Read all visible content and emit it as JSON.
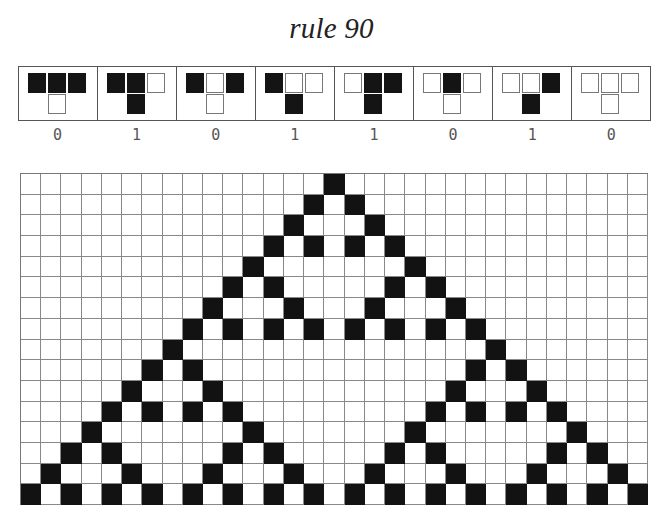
{
  "title": "rule 90",
  "rule": {
    "number": 90,
    "neighborhoods": [
      {
        "pattern": "111",
        "output": 0,
        "label": "0"
      },
      {
        "pattern": "110",
        "output": 1,
        "label": "1"
      },
      {
        "pattern": "101",
        "output": 0,
        "label": "0"
      },
      {
        "pattern": "100",
        "output": 1,
        "label": "1"
      },
      {
        "pattern": "011",
        "output": 1,
        "label": "1"
      },
      {
        "pattern": "010",
        "output": 0,
        "label": "0"
      },
      {
        "pattern": "001",
        "output": 1,
        "label": "1"
      },
      {
        "pattern": "000",
        "output": 0,
        "label": "0"
      }
    ]
  },
  "grid": {
    "columns": 31,
    "rows": 16,
    "colors": {
      "on": "#121212",
      "off": "#ffffff",
      "line": "#888888"
    },
    "states": [
      "0000000000000001000000000000000",
      "0000000000000010100000000000000",
      "0000000000000100010000000000000",
      "0000000000001010101000000000000",
      "0000000000010000000100000000000",
      "0000000000101000001010000000000",
      "0000000001000100010001000000000",
      "0000000010101010101010100000000",
      "0000000100000000000000010000000",
      "0000001010000000000000101000000",
      "0000010001000000000001000100000",
      "0000101010100000000010101010000",
      "0001000000010000000100000001000",
      "0010100000101000001010000010100",
      "0100010001000100010001000100010",
      "1010101010101010101010101010101"
    ]
  }
}
